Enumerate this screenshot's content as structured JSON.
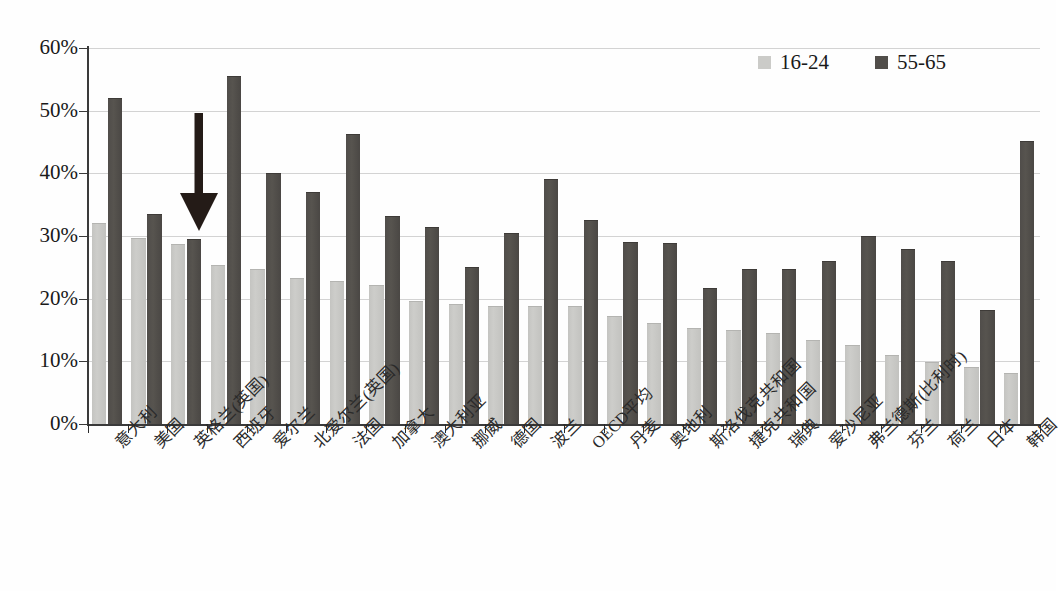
{
  "chart_data": {
    "type": "bar",
    "title": "",
    "subtitle": "",
    "xlabel": "",
    "ylabel": "",
    "ylim": [
      0,
      60
    ],
    "ytick_values": [
      0,
      10,
      20,
      30,
      40,
      50,
      60
    ],
    "ytick_labels": [
      "0%",
      "10%",
      "20%",
      "30%",
      "40%",
      "50%",
      "60%"
    ],
    "grid": true,
    "legend_position": "top-right",
    "value_suffix": "%",
    "categories": [
      "意大利",
      "美国",
      "英格兰(英国)",
      "西班牙",
      "爱尔兰",
      "北爱尔兰(英国)",
      "法国",
      "加拿大",
      "澳大利亚",
      "挪威",
      "德国",
      "波兰",
      "OECD平均",
      "丹麦",
      "奥地利",
      "斯洛伐克共和国",
      "捷克共和国",
      "瑞典",
      "爱沙尼亚",
      "弗兰德斯(比利时)",
      "芬兰",
      "荷兰",
      "日本",
      "韩国"
    ],
    "series": [
      {
        "name": "16-24",
        "color": "#cbcbc8",
        "values": [
          31.9,
          29.6,
          28.5,
          25.2,
          24.6,
          23.2,
          22.6,
          22.1,
          19.5,
          19.0,
          18.6,
          18.6,
          18.6,
          17.0,
          16.0,
          15.1,
          14.8,
          14.3,
          13.3,
          12.4,
          10.9,
          9.7,
          8.9,
          8.0
        ]
      },
      {
        "name": "55-65",
        "color": "#514e4a",
        "values": [
          51.8,
          33.4,
          29.3,
          55.4,
          39.9,
          36.8,
          46.1,
          33.1,
          31.2,
          24.9,
          30.4,
          38.9,
          32.4,
          28.9,
          28.7,
          21.5,
          24.6,
          24.6,
          25.9,
          29.8,
          27.7,
          25.9,
          18.0,
          45.0
        ]
      }
    ],
    "annotations": [
      {
        "type": "down-arrow",
        "target_category": "英格兰(英国)",
        "color": "#241b17"
      }
    ]
  },
  "legend": {
    "items": [
      {
        "label": "16-24"
      },
      {
        "label": "55-65"
      }
    ]
  }
}
